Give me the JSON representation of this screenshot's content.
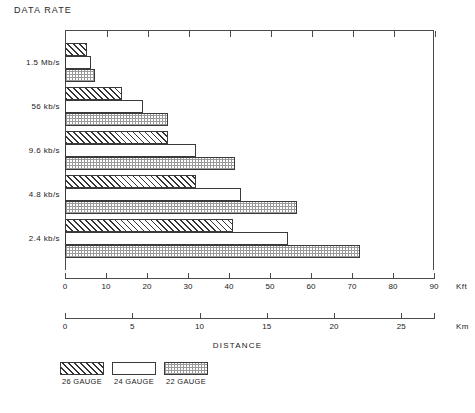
{
  "chart_data": {
    "type": "bar",
    "orientation": "horizontal",
    "title": "DATA RATE",
    "xlabel": "DISTANCE",
    "ylabel": "DATA RATE",
    "categories": [
      "1.5 Mb/s",
      "56 kb/s",
      "9.6 kb/s",
      "4.8 kb/s",
      "2.4 kb/s"
    ],
    "series": [
      {
        "name": "26 GAUGE",
        "pattern": "diagonal-hatch",
        "values": [
          5.4,
          14.0,
          25.0,
          32.0,
          41.0
        ]
      },
      {
        "name": "24 GAUGE",
        "pattern": "solid-white",
        "values": [
          6.3,
          19.0,
          32.0,
          43.0,
          54.5
        ]
      },
      {
        "name": "22 GAUGE",
        "pattern": "fine-dot",
        "values": [
          7.3,
          25.0,
          41.5,
          56.5,
          72.0
        ]
      }
    ],
    "units": "Kft",
    "xlim": [
      0,
      90
    ],
    "grid": false,
    "legend_position": "bottom-left",
    "axes": [
      {
        "name": "kft-axis",
        "unit": "Kft",
        "min": 0,
        "max": 90,
        "ticks": [
          0,
          10,
          20,
          30,
          40,
          50,
          60,
          70,
          80,
          90
        ],
        "ticklabels": [
          "0",
          "10",
          "20",
          "30",
          "40",
          "50",
          "60",
          "70",
          "80",
          "90"
        ]
      },
      {
        "name": "km-axis",
        "unit": "Km",
        "min": 0,
        "max": 27.432,
        "ticks": [
          0,
          5,
          10,
          15,
          20,
          25
        ],
        "ticklabels": [
          "0",
          "5",
          "10",
          "15",
          "20",
          "25"
        ]
      }
    ]
  },
  "legend": {
    "items": [
      {
        "label": "26 GAUGE"
      },
      {
        "label": "24 GAUGE"
      },
      {
        "label": "22 GAUGE"
      }
    ]
  },
  "colors": {
    "ink": "#1d1d1d",
    "rule": "#4a4a4a",
    "background": "#ffffff"
  }
}
